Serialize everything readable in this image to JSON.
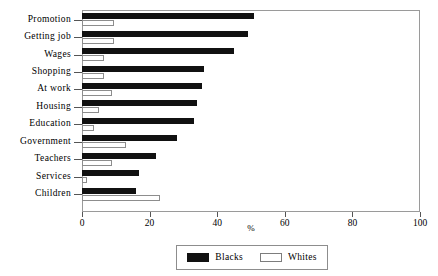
{
  "chart_data": {
    "type": "bar",
    "orientation": "horizontal",
    "title": "",
    "xlabel": "%",
    "ylabel": "",
    "xlim": [
      0,
      100
    ],
    "xticks": [
      0,
      20,
      40,
      60,
      80,
      100
    ],
    "grid": false,
    "legend_position": "bottom-center",
    "categories": [
      "Promotion",
      "Getting job",
      "Wages",
      "Shopping",
      "At work",
      "Housing",
      "Education",
      "Government",
      "Teachers",
      "Services",
      "Children"
    ],
    "series": [
      {
        "name": "Blacks",
        "color": "#111111",
        "values": [
          51,
          49,
          45,
          36,
          35.5,
          34,
          33,
          28,
          22,
          17,
          16
        ]
      },
      {
        "name": "Whites",
        "color": "#ffffff",
        "values": [
          9.5,
          9.5,
          6.5,
          6.5,
          9,
          5,
          3.5,
          13,
          9,
          1.5,
          23
        ]
      }
    ]
  },
  "legend": {
    "entries": [
      {
        "label": "Blacks",
        "swatch": "filled-black-swatch"
      },
      {
        "label": "Whites",
        "swatch": "outlined-white-swatch"
      }
    ]
  },
  "axis": {
    "x_title": "%",
    "tick_labels": [
      "0",
      "20",
      "40",
      "60",
      "80",
      "100"
    ]
  }
}
